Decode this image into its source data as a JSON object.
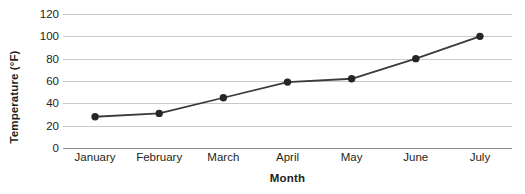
{
  "chart_data": {
    "type": "line",
    "title": "",
    "xlabel": "Month",
    "ylabel": "Temperature (°F)",
    "categories": [
      "January",
      "February",
      "March",
      "April",
      "May",
      "June",
      "July"
    ],
    "values": [
      28,
      31,
      45,
      59,
      62,
      80,
      100
    ],
    "series": [
      {
        "name": "Temperature",
        "values": [
          28,
          31,
          45,
          59,
          62,
          80,
          100
        ]
      }
    ],
    "ylim": [
      0,
      120
    ],
    "ytick_labels": [
      "120",
      "100",
      "80",
      "60",
      "40",
      "20",
      "0"
    ],
    "ytick_values": [
      120,
      100,
      80,
      60,
      40,
      20,
      0
    ],
    "ytick_step": 20,
    "grid": true,
    "grid_orientation": "horizontal",
    "legend": "none",
    "line_color": "#3b3b3b",
    "marker_color": "#262626",
    "marker_shape": "circle",
    "gridline_color": "#c9c9c9",
    "axis_color": "#8c8c8c",
    "text_color": "#231f20",
    "background_color": "#ffffff"
  }
}
